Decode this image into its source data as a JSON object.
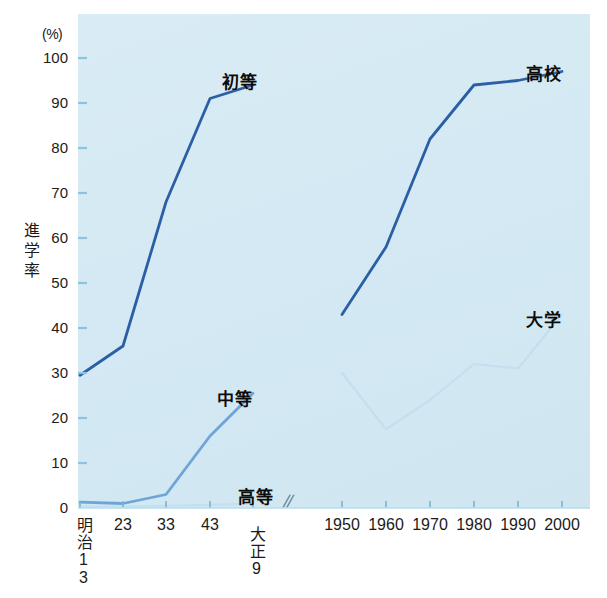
{
  "chart_data": {
    "type": "line",
    "title": "",
    "xlabel": "",
    "ylabel": "進学率",
    "unit_label": "(%)",
    "ylim": [
      0,
      100
    ],
    "ytick_labels": [
      "100",
      "90",
      "80",
      "70",
      "60",
      "50",
      "40",
      "30",
      "20",
      "10",
      "0"
    ],
    "ytick_values": [
      100,
      90,
      80,
      70,
      60,
      50,
      40,
      30,
      20,
      10,
      0
    ],
    "grid": false,
    "legend_position": "inline-annotations",
    "axis_break": "//",
    "panels": [
      {
        "name": "prewar",
        "categories": [
          "明治13",
          "23",
          "33",
          "43",
          "大正9"
        ],
        "category_lines": [
          [
            "明",
            "治",
            "13"
          ],
          [
            "23"
          ],
          [
            "33"
          ],
          [
            "43"
          ],
          [
            "大",
            "正",
            "9"
          ]
        ],
        "series": [
          {
            "name": "初等",
            "label": "初等",
            "color": "#2b5fa5",
            "values": [
              29.5,
              36,
              68,
              91,
              94
            ]
          },
          {
            "name": "中等",
            "label": "中等",
            "color": "#6fa4d8",
            "values": [
              1.3,
              1.0,
              3.0,
              16,
              25.5
            ]
          },
          {
            "name": "高等",
            "label": "高等",
            "color": "#c3dff0",
            "values": [
              0.3,
              0.3,
              0.5,
              0.7,
              1.0
            ]
          }
        ]
      },
      {
        "name": "postwar",
        "categories": [
          "1950",
          "1960",
          "1970",
          "1980",
          "1990",
          "2000"
        ],
        "series": [
          {
            "name": "高校",
            "label": "高校",
            "color": "#2b5fa5",
            "values": [
              43,
              58,
              82,
              94,
              95,
              97
            ]
          },
          {
            "name": "大学",
            "label": "大学",
            "color": "#c3dff0",
            "values": [
              30,
              17.5,
              24,
              32,
              31,
              43
            ]
          }
        ]
      }
    ],
    "annotations": [
      {
        "text": "初等",
        "x": 222,
        "y": 68
      },
      {
        "text": "中等",
        "x": 217,
        "y": 385
      },
      {
        "text": "高等",
        "x": 238,
        "y": 483
      },
      {
        "text": "高校",
        "x": 526,
        "y": 60
      },
      {
        "text": "大学",
        "x": 526,
        "y": 306
      }
    ],
    "colors": {
      "plot_background": "#d7ebf4",
      "dark_blue": "#2b5fa5",
      "mid_blue": "#6fa4d8",
      "pale_blue": "#c3dff0",
      "text": "#1b1b1b"
    }
  }
}
